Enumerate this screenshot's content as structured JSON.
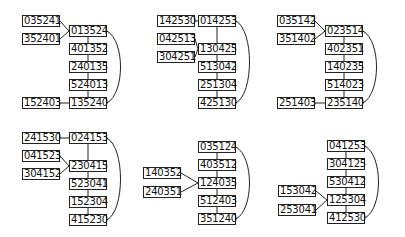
{
  "panels": [
    {
      "offset": [
        0,
        0
      ],
      "chain": [
        "013524",
        "401352",
        "240135",
        "524013",
        "135240"
      ],
      "chain_y": [
        25,
        43,
        61,
        79,
        97
      ],
      "side": [
        {
          "label": "035241",
          "y": 15,
          "to": 0
        },
        {
          "label": "352401",
          "y": 33,
          "to": 0
        },
        {
          "label": "152403",
          "y": 97,
          "to": 4
        }
      ]
    },
    {
      "offset": [
        135,
        0
      ],
      "chain": [
        "014253",
        "130425",
        "513042",
        "251304",
        "425130"
      ],
      "chain_y": [
        15,
        43,
        61,
        79,
        97
      ],
      "side": [
        {
          "label": "142530",
          "y": 15,
          "to": 0
        },
        {
          "label": "042513",
          "y": 33,
          "to": 1
        },
        {
          "label": "304251",
          "y": 51,
          "to": 1
        }
      ]
    },
    {
      "offset": [
        270,
        0
      ],
      "chain": [
        "023514",
        "402351",
        "140235",
        "514023",
        "235140"
      ],
      "chain_y": [
        25,
        43,
        61,
        79,
        97
      ],
      "side": [
        {
          "label": "035142",
          "y": 15,
          "to": 0
        },
        {
          "label": "351402",
          "y": 33,
          "to": 0
        },
        {
          "label": "251403",
          "y": 97,
          "to": 4
        }
      ]
    },
    {
      "offset": [
        0,
        120
      ],
      "chain": [
        "024153",
        "230415",
        "523041",
        "152304",
        "415230"
      ],
      "chain_y": [
        12,
        40,
        58,
        76,
        94
      ],
      "side": [
        {
          "label": "241530",
          "y": 12,
          "to": 0
        },
        {
          "label": "041523",
          "y": 30,
          "to": 1
        },
        {
          "label": "304152",
          "y": 48,
          "to": 1
        }
      ]
    },
    {
      "offset": [
        135,
        120
      ],
      "chain": [
        "035124",
        "403512",
        "124035",
        "512403",
        "351240"
      ],
      "chain_y": [
        21,
        39,
        57,
        75,
        93
      ],
      "side": [
        {
          "label": "140352",
          "y": 47,
          "to": 2
        },
        {
          "label": "240351",
          "y": 66,
          "to": 2
        }
      ]
    },
    {
      "offset": [
        270,
        120
      ],
      "chain": [
        "041253",
        "304125",
        "530412",
        "125304",
        "412530"
      ],
      "chain_y": [
        20,
        38,
        56,
        74,
        92
      ],
      "side": [
        {
          "label": "153042",
          "y": 65,
          "to": 3
        },
        {
          "label": "253041",
          "y": 84,
          "to": 3
        }
      ]
    }
  ]
}
